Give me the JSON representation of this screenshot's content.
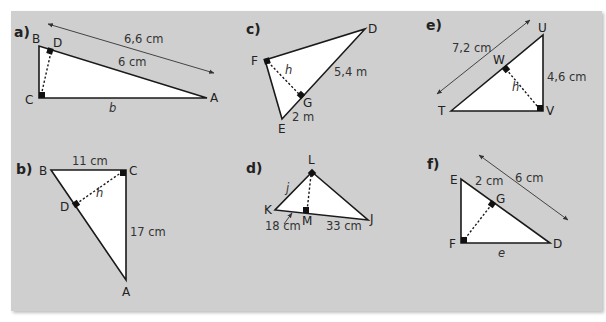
{
  "figure": {
    "background": "#cfcfcf"
  },
  "problems": {
    "a": {
      "label": "a)",
      "vertices": {
        "B": "B",
        "D": "D",
        "C": "C",
        "A": "A"
      },
      "measures": {
        "hypotenuse": "6,6 cm",
        "segment_DA": "6 cm",
        "side_b": "b"
      }
    },
    "b": {
      "label": "b)",
      "vertices": {
        "B": "B",
        "C": "C",
        "D": "D",
        "A": "A"
      },
      "measures": {
        "side_BC": "11 cm",
        "side_CA": "17 cm",
        "altitude": "h"
      }
    },
    "c": {
      "label": "c)",
      "vertices": {
        "F": "F",
        "D": "D",
        "G": "G",
        "E": "E"
      },
      "measures": {
        "segment_GD": "5,4 m",
        "segment_EG": "2 m",
        "altitude": "h"
      }
    },
    "d": {
      "label": "d)",
      "vertices": {
        "L": "L",
        "K": "K",
        "M": "M",
        "J": "J"
      },
      "measures": {
        "side_j": "j",
        "segment_KM": "18 cm",
        "segment_MJ": "33 cm"
      }
    },
    "e": {
      "label": "e)",
      "vertices": {
        "U": "U",
        "W": "W",
        "T": "T",
        "V": "V"
      },
      "measures": {
        "hypotenuse": "7,2 cm",
        "side_UV": "4,6 cm",
        "altitude": "h"
      }
    },
    "f": {
      "label": "f)",
      "vertices": {
        "E": "E",
        "G": "G",
        "F": "F",
        "D": "D"
      },
      "measures": {
        "segment_EG": "2 cm",
        "hypotenuse": "6 cm",
        "side_e": "e"
      }
    }
  }
}
